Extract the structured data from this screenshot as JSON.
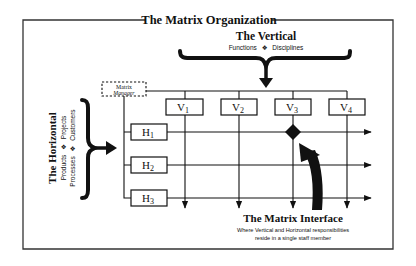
{
  "title": "The Matrix Organization",
  "vertical": {
    "heading": "The Vertical",
    "subtitle_items": [
      "Functions",
      "Disciplines"
    ],
    "separator": "❖"
  },
  "horizontal": {
    "heading": "The Horizontal",
    "line1_items": [
      "Products",
      "Projects"
    ],
    "line2_items": [
      "Processes",
      "Customers"
    ],
    "separator": "❖"
  },
  "manager": {
    "line1": "Matrix",
    "line2": "Manager"
  },
  "verticals": [
    {
      "letter": "V",
      "sub": "1"
    },
    {
      "letter": "V",
      "sub": "2"
    },
    {
      "letter": "V",
      "sub": "3"
    },
    {
      "letter": "V",
      "sub": "4"
    }
  ],
  "horizontals": [
    {
      "letter": "H",
      "sub": "1"
    },
    {
      "letter": "H",
      "sub": "2"
    },
    {
      "letter": "H",
      "sub": "3"
    }
  ],
  "interface": {
    "heading": "The Matrix Interface",
    "desc_line1": "Where Vertical and Horizontal responsibilities",
    "desc_line2": "reside in a single staff member",
    "highlight": {
      "vertical": "V3",
      "horizontal": "H1"
    }
  },
  "colors": {
    "ink": "#111111",
    "frame": "#333333",
    "background": "#ffffff"
  }
}
